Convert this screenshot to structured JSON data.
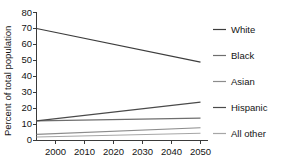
{
  "chart_data": {
    "type": "line",
    "title": "",
    "xlabel": "",
    "ylabel": "Percent of total population",
    "x": [
      2000,
      2050
    ],
    "xticklabels": [
      "2000",
      "2010",
      "2020",
      "2030",
      "2040",
      "2050"
    ],
    "xlim": [
      2000,
      2050
    ],
    "ylim": [
      0,
      80
    ],
    "yticks": [
      0,
      10,
      20,
      30,
      40,
      50,
      60,
      70,
      80
    ],
    "yticklabels": [
      "0",
      "10",
      "20",
      "30",
      "40",
      "50",
      "60",
      "70",
      "80"
    ],
    "grid": false,
    "legend_position": "right",
    "series": [
      {
        "name": "White",
        "values": [
          70.0,
          49.0
        ],
        "color": "#3d3d3d"
      },
      {
        "name": "Black",
        "values": [
          12.3,
          14.0
        ],
        "color": "#6e6e6e"
      },
      {
        "name": "Asian",
        "values": [
          3.8,
          8.0
        ],
        "color": "#8c8c8c"
      },
      {
        "name": "Hispanic",
        "values": [
          12.3,
          24.0
        ],
        "color": "#4a4a4a"
      },
      {
        "name": "All other",
        "values": [
          2.2,
          4.5
        ],
        "color": "#a6a6a6"
      }
    ]
  },
  "axes": {
    "ylabel": "Percent of total population",
    "ytick_0": "0",
    "ytick_1": "10",
    "ytick_2": "20",
    "ytick_3": "30",
    "ytick_4": "40",
    "ytick_5": "50",
    "ytick_6": "60",
    "ytick_7": "70",
    "ytick_8": "80",
    "xtick_0": "2000",
    "xtick_1": "2010",
    "xtick_2": "2020",
    "xtick_3": "2030",
    "xtick_4": "2040",
    "xtick_5": "2050"
  },
  "legend": {
    "item_0": "White",
    "item_1": "Black",
    "item_2": "Asian",
    "item_3": "Hispanic",
    "item_4": "All other"
  }
}
